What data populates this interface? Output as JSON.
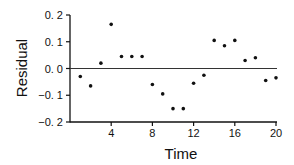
{
  "chart_data": {
    "type": "scatter",
    "title": "",
    "xlabel": "Time",
    "ylabel": "Residual",
    "xlim": [
      0,
      20.5
    ],
    "ylim": [
      -0.2,
      0.2
    ],
    "xticks": [
      4,
      8,
      12,
      16,
      20
    ],
    "xtick_labels": [
      "4",
      "8",
      "12",
      "16",
      "20"
    ],
    "yticks": [
      0.2,
      0.1,
      0.0,
      -0.1,
      -0.2
    ],
    "ytick_labels": [
      "0. 2",
      "0. 1",
      "0. 0",
      "−0. 1",
      "−0. 2"
    ],
    "reference_line": 0.0,
    "grid": false,
    "series": [
      {
        "name": "Residual",
        "x": [
          1,
          2,
          3,
          4,
          5,
          6,
          7,
          8,
          9,
          10,
          11,
          12,
          13,
          14,
          15,
          16,
          17,
          18,
          19,
          20
        ],
        "y": [
          -0.03,
          -0.065,
          0.02,
          0.165,
          0.045,
          0.045,
          0.045,
          -0.06,
          -0.095,
          -0.15,
          -0.15,
          -0.055,
          -0.025,
          0.105,
          0.085,
          0.105,
          0.03,
          0.04,
          -0.045,
          -0.035
        ]
      }
    ]
  }
}
